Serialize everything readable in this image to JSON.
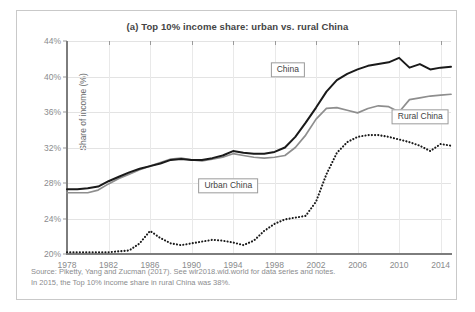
{
  "chart_data": {
    "type": "line",
    "title": "(a) Top 10% income share: urban vs. rural China",
    "xlabel": "",
    "ylabel": "Share of income (%)",
    "xlim": [
      1978,
      2015
    ],
    "ylim": [
      20,
      44
    ],
    "ytick_labels": [
      "20%",
      "24%",
      "28%",
      "32%",
      "36%",
      "40%",
      "44%"
    ],
    "ytick_values": [
      20,
      24,
      28,
      32,
      36,
      40,
      44
    ],
    "xtick_labels": [
      "1978",
      "1982",
      "1986",
      "1990",
      "1994",
      "1998",
      "2002",
      "2006",
      "2010",
      "2014"
    ],
    "xtick_values": [
      1978,
      1982,
      1986,
      1990,
      1994,
      1998,
      2002,
      2006,
      2010,
      2014
    ],
    "grid": true,
    "legend_position": "inline-callouts",
    "x": [
      1978,
      1979,
      1980,
      1981,
      1982,
      1983,
      1984,
      1985,
      1986,
      1987,
      1988,
      1989,
      1990,
      1991,
      1992,
      1993,
      1994,
      1995,
      1996,
      1997,
      1998,
      1999,
      2000,
      2001,
      2002,
      2003,
      2004,
      2005,
      2006,
      2007,
      2008,
      2009,
      2010,
      2011,
      2012,
      2013,
      2014,
      2015
    ],
    "series": [
      {
        "name": "China",
        "color": "#1a1a1a",
        "style": "solid",
        "values": [
          27.3,
          27.3,
          27.4,
          27.6,
          28.2,
          28.7,
          29.2,
          29.6,
          29.9,
          30.2,
          30.6,
          30.7,
          30.6,
          30.6,
          30.8,
          31.1,
          31.6,
          31.4,
          31.3,
          31.3,
          31.5,
          32.0,
          33.2,
          34.8,
          36.5,
          38.3,
          39.6,
          40.3,
          40.8,
          41.2,
          41.4,
          41.6,
          42.1,
          41.0,
          41.4,
          40.8,
          41.0,
          41.1
        ]
      },
      {
        "name": "Rural China",
        "color": "#8e8e8e",
        "style": "solid",
        "values": [
          26.9,
          26.9,
          26.9,
          27.2,
          27.9,
          28.5,
          29.0,
          29.5,
          29.9,
          30.3,
          30.7,
          30.8,
          30.6,
          30.5,
          30.7,
          30.9,
          31.3,
          31.1,
          30.9,
          30.8,
          30.9,
          31.1,
          32.0,
          33.4,
          35.2,
          36.4,
          36.5,
          36.2,
          35.9,
          36.4,
          36.7,
          36.6,
          36.0,
          37.4,
          37.6,
          37.8,
          37.9,
          38.0
        ]
      },
      {
        "name": "Urban China",
        "color": "#1a1a1a",
        "style": "dotted",
        "values": [
          20.2,
          20.2,
          20.2,
          20.2,
          20.2,
          20.3,
          20.4,
          21.2,
          22.6,
          21.8,
          21.2,
          21.0,
          21.2,
          21.4,
          21.6,
          21.5,
          21.3,
          21.0,
          21.5,
          22.6,
          23.4,
          23.9,
          24.1,
          24.3,
          25.9,
          29.0,
          31.4,
          32.6,
          33.2,
          33.4,
          33.4,
          33.2,
          32.9,
          32.6,
          32.2,
          31.6,
          32.4,
          32.2
        ]
      }
    ]
  },
  "callouts": [
    {
      "label": "China",
      "x_pct": 57.5,
      "y_pct": 13.5
    },
    {
      "label": "Rural China",
      "x_pct": 92.0,
      "y_pct": 35.5
    },
    {
      "label": "Urban China",
      "x_pct": 42.0,
      "y_pct": 68.0
    }
  ],
  "footer": {
    "line1": "Source: Piketty, Yang and Zucman (2017). See wir2018.wid.world for data series and notes.",
    "line2": "In 2015, the Top 10% income share in rural China was 38%."
  }
}
